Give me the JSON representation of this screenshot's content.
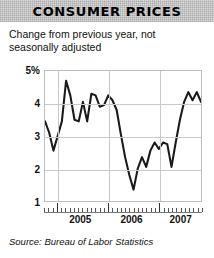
{
  "header": {
    "title": "CONSUMER PRICES"
  },
  "subtitle": "Change from previous year, not seasonally adjusted",
  "source": "Source: Bureau of Labor Statistics",
  "axis": {
    "y_ticks": [
      "5%",
      "4",
      "3",
      "2",
      "1"
    ],
    "x_ticks": [
      "2005",
      "2006",
      "2007"
    ]
  },
  "colors": {
    "line": "#1a1a1a",
    "grid": "#c9c9c9",
    "frame": "#bdbdbd",
    "title_band": "#d8d8d8"
  },
  "chart_data": {
    "type": "line",
    "title": "CONSUMER PRICES",
    "subtitle": "Change from previous year, not seasonally adjusted",
    "xlabel": "",
    "ylabel": "Percent change from previous year",
    "ylim": [
      1,
      5
    ],
    "yticks": [
      1,
      2,
      3,
      4,
      5
    ],
    "ytick_labels": [
      "1",
      "2",
      "3",
      "4",
      "5%"
    ],
    "grid": true,
    "legend": null,
    "source": "Source: Bureau of Labor Statistics",
    "x": [
      "2004-10",
      "2004-11",
      "2004-12",
      "2005-01",
      "2005-02",
      "2005-03",
      "2005-04",
      "2005-05",
      "2005-06",
      "2005-07",
      "2005-08",
      "2005-09",
      "2005-10",
      "2005-11",
      "2005-12",
      "2006-01",
      "2006-02",
      "2006-03",
      "2006-04",
      "2006-05",
      "2006-06",
      "2006-07",
      "2006-08",
      "2006-09",
      "2006-10",
      "2006-11",
      "2006-12",
      "2007-01",
      "2007-02",
      "2007-03",
      "2007-04",
      "2007-05",
      "2007-06",
      "2007-07",
      "2007-08",
      "2007-09",
      "2007-10",
      "2007-11"
    ],
    "xtick_labels": [
      "2005",
      "2006",
      "2007"
    ],
    "series": [
      {
        "name": "CPI year-over-year change",
        "units": "percent",
        "values": [
          3.45,
          3.1,
          2.55,
          3.0,
          3.45,
          4.7,
          4.25,
          3.5,
          3.45,
          4.05,
          3.45,
          4.3,
          4.25,
          3.9,
          3.95,
          4.25,
          4.1,
          3.8,
          3.05,
          2.35,
          1.8,
          1.35,
          2.0,
          2.35,
          2.05,
          2.55,
          2.8,
          2.6,
          2.8,
          2.75,
          2.05,
          2.8,
          3.5,
          4.05,
          4.35,
          4.1,
          4.35,
          4.05
        ]
      }
    ]
  }
}
